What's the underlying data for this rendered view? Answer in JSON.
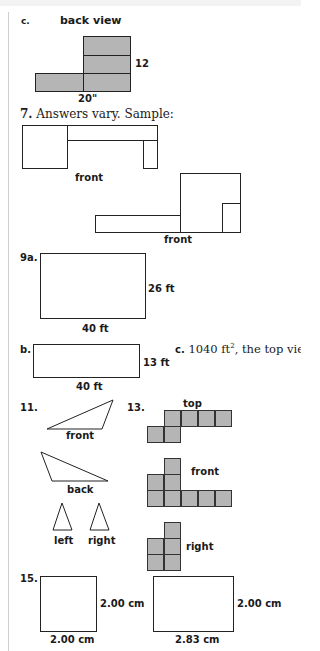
{
  "problem_c": {
    "label": "c.",
    "title": "back view",
    "dim_height": "12",
    "dim_width": "20\""
  },
  "problem_7": {
    "label": "7.",
    "text": "Answers vary. Sample:",
    "view1_label": "front",
    "view2_label": "front"
  },
  "problem_9": {
    "a_label": "9a.",
    "a_height": "26 ft",
    "a_width": "40 ft",
    "b_label": "b.",
    "b_height": "13 ft",
    "b_width": "40 ft",
    "c_label": "c.",
    "c_text_pre": "1040 ft",
    "c_text_sup": "2",
    "c_text_post": ", the top view"
  },
  "problem_11": {
    "label": "11.",
    "front": "front",
    "back": "back",
    "left": "left",
    "right": "right"
  },
  "problem_13": {
    "label": "13.",
    "top": "top",
    "front": "front",
    "right": "right"
  },
  "problem_15": {
    "label": "15.",
    "sq_height": "2.00 cm",
    "sq_width": "2.00 cm",
    "rect_height": "2.00 cm",
    "rect_width": "2.83 cm"
  },
  "colors": {
    "fill_gray": "#b5b5b5",
    "line": "#222222"
  }
}
